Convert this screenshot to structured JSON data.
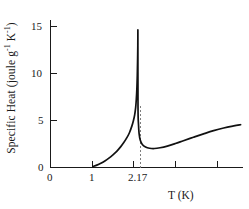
{
  "chart_data": {
    "type": "line",
    "title": "",
    "subtitle": "",
    "xlabel": "T (K)",
    "ylabel": "Specific Heat (joule g⁻¹ K⁻¹)",
    "ylabel_parts": {
      "prefix": "Specific Heat (joule g",
      "exp1": "-1",
      "middle": " K",
      "exp2": "-1",
      "suffix": ")"
    },
    "xlim": [
      0,
      4.78
    ],
    "ylim": [
      0,
      16.4
    ],
    "grid": false,
    "legend": null,
    "x_ticks": [
      {
        "value": 0,
        "label": "0"
      },
      {
        "value": 1,
        "label": "1"
      },
      {
        "value": 2,
        "label": ""
      },
      {
        "value": 3,
        "label": ""
      },
      {
        "value": 4,
        "label": ""
      }
    ],
    "y_ticks": [
      {
        "value": 0,
        "label": "0"
      },
      {
        "value": 5,
        "label": "5"
      },
      {
        "value": 10,
        "label": "10"
      },
      {
        "value": 15,
        "label": "15"
      }
    ],
    "annotations": [
      {
        "name": "lambda-point",
        "label": "2.17",
        "x": 2.17,
        "type": "vertical-dashed-line",
        "color": "#7d7d7d"
      }
    ],
    "series": [
      {
        "name": "specific heat of liquid helium-4",
        "color": "#111111",
        "points": [
          [
            1.05,
            0.1
          ],
          [
            1.15,
            0.25
          ],
          [
            1.25,
            0.45
          ],
          [
            1.35,
            0.7
          ],
          [
            1.45,
            1.0
          ],
          [
            1.55,
            1.35
          ],
          [
            1.65,
            1.75
          ],
          [
            1.75,
            2.25
          ],
          [
            1.82,
            2.65
          ],
          [
            1.9,
            3.2
          ],
          [
            1.96,
            3.7
          ],
          [
            2.02,
            4.4
          ],
          [
            2.06,
            5.0
          ],
          [
            2.09,
            5.6
          ],
          [
            2.115,
            6.4
          ],
          [
            2.13,
            7.2
          ],
          [
            2.145,
            8.4
          ],
          [
            2.155,
            9.8
          ],
          [
            2.162,
            11.3
          ],
          [
            2.168,
            13.0
          ],
          [
            2.17,
            14.3
          ],
          [
            2.173,
            6.4
          ],
          [
            2.185,
            4.6
          ],
          [
            2.2,
            3.6
          ],
          [
            2.23,
            2.9
          ],
          [
            2.28,
            2.45
          ],
          [
            2.36,
            2.18
          ],
          [
            2.46,
            2.05
          ],
          [
            2.58,
            2.02
          ],
          [
            2.72,
            2.1
          ],
          [
            2.9,
            2.28
          ],
          [
            3.1,
            2.55
          ],
          [
            3.3,
            2.85
          ],
          [
            3.55,
            3.22
          ],
          [
            3.8,
            3.58
          ],
          [
            4.05,
            3.92
          ],
          [
            4.3,
            4.2
          ],
          [
            4.55,
            4.42
          ],
          [
            4.72,
            4.55
          ]
        ]
      }
    ]
  }
}
